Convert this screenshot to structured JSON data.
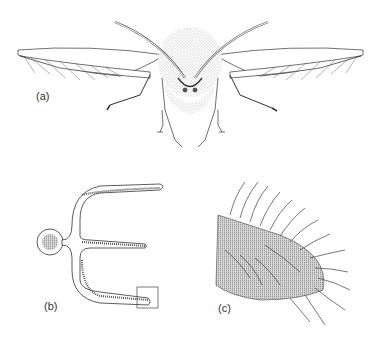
{
  "figure": {
    "panels": [
      {
        "id": "a",
        "label": "(a)",
        "description": "moth, frontal view with wings spread"
      },
      {
        "id": "b",
        "label": "(b)",
        "description": "forked structure with hairy margins and boxed tip region"
      },
      {
        "id": "c",
        "label": "(c)",
        "description": "magnified tip covered in bristles"
      }
    ]
  }
}
